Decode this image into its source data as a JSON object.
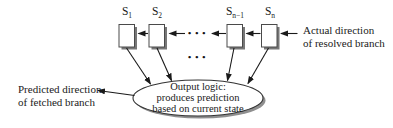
{
  "diagram": {
    "title_hint": "Branch predictor state diagram",
    "registers": [
      {
        "base": "S",
        "sub": "1"
      },
      {
        "base": "S",
        "sub": "2"
      },
      {
        "base": "S",
        "sub": "n−1"
      },
      {
        "base": "S",
        "sub": "n"
      }
    ],
    "dots": "•••",
    "output_ellipse": {
      "line1": "Output logic:",
      "line2": "produces prediction",
      "line3": "based on current state"
    },
    "right_label": {
      "line1": "Actual direction",
      "line2": "of resolved branch"
    },
    "left_label": {
      "line1": "Predicted direction",
      "line2": "of fetched branch"
    },
    "colors": {
      "line": "#1a1a1a",
      "box_border": "#4a4a4a",
      "box_fill": "#ffffff",
      "box_shadow": "#777777",
      "ellipse_border": "#333333",
      "ellipse_shadow": "#8f8f8f",
      "background": "#ffffff"
    }
  }
}
